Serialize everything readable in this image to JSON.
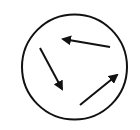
{
  "diagram": {
    "stroke_color": "#111111",
    "background": "#ffffff",
    "circle": {
      "cx": 74.5,
      "cy": 67,
      "r": 52.5,
      "stroke_width": 2
    },
    "arrows": [
      {
        "name": "arrow-top-left",
        "x1": 110,
        "y1": 47,
        "x2": 63,
        "y2": 39
      },
      {
        "name": "arrow-down",
        "x1": 40,
        "y1": 48,
        "x2": 62,
        "y2": 89
      },
      {
        "name": "arrow-up-right",
        "x1": 80,
        "y1": 105,
        "x2": 117,
        "y2": 75
      }
    ]
  }
}
